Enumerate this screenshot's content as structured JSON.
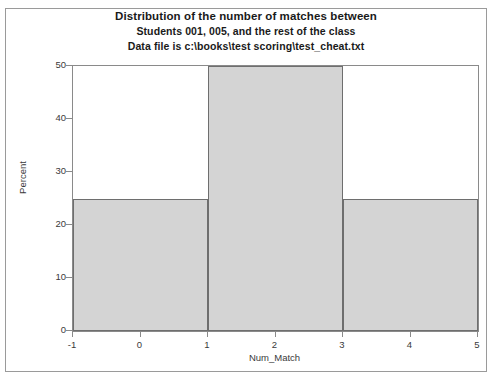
{
  "chart_data": {
    "type": "bar",
    "title": "Distribution of the number of matches between",
    "subtitle": "Students 001, 005, and the rest of the class",
    "subtitle2": "Data file is c:\\books\\test scoring\\test_cheat.txt",
    "xlabel": "Num_Match",
    "ylabel": "Percent",
    "xlim": [
      -1,
      5
    ],
    "ylim": [
      0,
      50
    ],
    "xticks": [
      "-1",
      "0",
      "1",
      "2",
      "3",
      "4",
      "5"
    ],
    "xtick_values": [
      -1,
      0,
      1,
      2,
      3,
      4,
      5
    ],
    "yticks": [
      "0",
      "10",
      "20",
      "30",
      "40",
      "50"
    ],
    "ytick_values": [
      0,
      10,
      20,
      30,
      40,
      50
    ],
    "grid": false,
    "legend": "none",
    "bin_edges": [
      -1,
      1,
      3,
      5
    ],
    "categories": [
      "-1 to 1",
      "1 to 3",
      "3 to 5"
    ],
    "values": [
      25,
      50,
      25
    ],
    "bars": [
      {
        "x0": -1,
        "x1": 1,
        "value": 25
      },
      {
        "x0": 1,
        "x1": 3,
        "value": 50
      },
      {
        "x0": 3,
        "x1": 5,
        "value": 25
      }
    ],
    "bar_fill_color": "#d4d4d4",
    "bar_edge_color": "#6e6e6e",
    "axis_color": "#8a8a8a",
    "text_color": "#3a3a3a",
    "background_color": "#ffffff"
  }
}
